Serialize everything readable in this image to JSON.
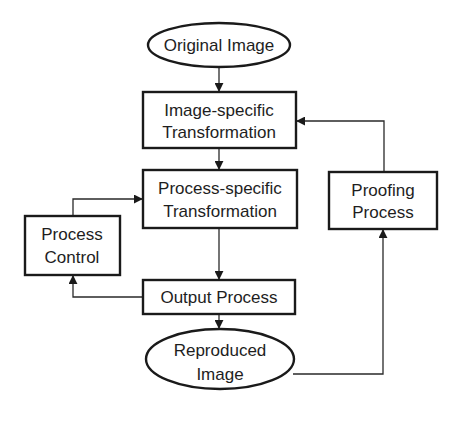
{
  "diagram": {
    "type": "flowchart",
    "nodes": {
      "original_image": {
        "shape": "ellipse",
        "lines": [
          "Original Image"
        ]
      },
      "image_specific": {
        "shape": "rect",
        "lines": [
          "Image-specific",
          "Transformation"
        ]
      },
      "process_specific": {
        "shape": "rect",
        "lines": [
          "Process-specific",
          "Transformation"
        ]
      },
      "process_control": {
        "shape": "rect",
        "lines": [
          "Process",
          "Control"
        ]
      },
      "proofing_process": {
        "shape": "rect",
        "lines": [
          "Proofing",
          "Process"
        ]
      },
      "output_process": {
        "shape": "rect",
        "lines": [
          "Output Process"
        ]
      },
      "reproduced_image": {
        "shape": "ellipse",
        "lines": [
          "Reproduced",
          "Image"
        ]
      }
    },
    "edges": [
      {
        "from": "Original Image",
        "to": "Image-specific Transformation"
      },
      {
        "from": "Image-specific Transformation",
        "to": "Process-specific Transformation"
      },
      {
        "from": "Process-specific Transformation",
        "to": "Output Process"
      },
      {
        "from": "Output Process",
        "to": "Reproduced Image"
      },
      {
        "from": "Output Process",
        "to": "Process Control"
      },
      {
        "from": "Process Control",
        "to": "Process-specific Transformation"
      },
      {
        "from": "Reproduced Image",
        "to": "Proofing Process"
      },
      {
        "from": "Proofing Process",
        "to": "Image-specific Transformation"
      }
    ],
    "colors": {
      "stroke": "#1a1a1a",
      "background": "#ffffff",
      "text": "#1e1e1e"
    }
  }
}
